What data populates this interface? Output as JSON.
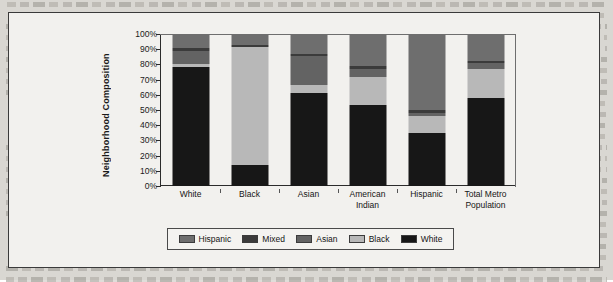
{
  "figure": {
    "frame_bg": "#f2f1ee",
    "frame_border": "#3a3a3a"
  },
  "chart_data": {
    "type": "bar",
    "subtype": "stacked-bar-100",
    "title": "",
    "xlabel": "",
    "ylabel": "Neighborhood Composition",
    "ylim": [
      0,
      100
    ],
    "ytick_labels": [
      "100%",
      "90%",
      "80%",
      "70%",
      "60%",
      "50%",
      "40%",
      "30%",
      "20%",
      "10%",
      "0%"
    ],
    "ytick_values": [
      100,
      90,
      80,
      70,
      60,
      50,
      40,
      30,
      20,
      10,
      0
    ],
    "grid": false,
    "legend_position": "bottom",
    "stack_order_bottom_to_top": [
      "White",
      "Black",
      "Asian",
      "Mixed",
      "Hispanic"
    ],
    "categories": [
      "White",
      "Black",
      "Asian",
      "American Indian",
      "Hispanic",
      "Total Metro Population"
    ],
    "series": [
      {
        "name": "Hispanic",
        "color": "#6e6e6e",
        "values": [
          9.0,
          7.0,
          13.0,
          21.0,
          50.0,
          17.5
        ]
      },
      {
        "name": "Mixed",
        "color": "#3b3b3b",
        "values": [
          2.0,
          1.5,
          1.5,
          2.0,
          2.0,
          1.5
        ]
      },
      {
        "name": "Asian",
        "color": "#636363",
        "values": [
          8.5,
          0.0,
          19.0,
          5.0,
          2.0,
          4.0
        ]
      },
      {
        "name": "Black",
        "color": "#b8b8b8",
        "values": [
          2.0,
          78.0,
          5.5,
          18.5,
          11.0,
          19.0
        ]
      },
      {
        "name": "White",
        "color": "#171717",
        "values": [
          78.5,
          13.5,
          61.0,
          53.5,
          35.0,
          58.0
        ]
      }
    ]
  },
  "legend": {
    "items": [
      {
        "label": "Hispanic",
        "color": "#6e6e6e"
      },
      {
        "label": "Mixed",
        "color": "#3b3b3b"
      },
      {
        "label": "Asian",
        "color": "#636363"
      },
      {
        "label": "Black",
        "color": "#b8b8b8"
      },
      {
        "label": "White",
        "color": "#171717"
      }
    ]
  }
}
